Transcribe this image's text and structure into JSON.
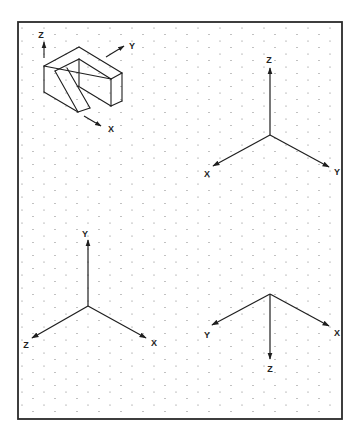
{
  "frame": {
    "x": 18,
    "y": 22,
    "w": 324,
    "h": 397,
    "stroke": "#2a2a2a",
    "stroke_width": 1.8
  },
  "grid": {
    "type": "isometric-dot",
    "dx": 11,
    "dy": 13,
    "dot_color": "#777777",
    "dot_radius": 0.6
  },
  "colors": {
    "line": "#1e1e1e",
    "label": "#222222"
  },
  "object": {
    "name": "isometric-bracket-sketch",
    "edges": [
      [
        44,
        66,
        79,
        47
      ],
      [
        79,
        47,
        122,
        73
      ],
      [
        122,
        73,
        111,
        79
      ],
      [
        111,
        79,
        44,
        66
      ],
      [
        44,
        66,
        44,
        92
      ],
      [
        44,
        92,
        78,
        112
      ],
      [
        111,
        79,
        111,
        106
      ],
      [
        122,
        73,
        122,
        101
      ],
      [
        122,
        101,
        111,
        106
      ],
      [
        79,
        59,
        111,
        79
      ],
      [
        79,
        59,
        79,
        86
      ],
      [
        78,
        86,
        111,
        106
      ],
      [
        55,
        71,
        79,
        59
      ],
      [
        55,
        71,
        78,
        112
      ],
      [
        67,
        68,
        90,
        108
      ],
      [
        78,
        112,
        90,
        108
      ]
    ],
    "axes": [
      {
        "label": "Z",
        "from": [
          44,
          58
        ],
        "to": [
          44,
          42
        ],
        "label_pos": [
          41,
          38
        ]
      },
      {
        "label": "Y",
        "from": [
          106,
          57
        ],
        "to": [
          124,
          46
        ],
        "label_pos": [
          132,
          49
        ]
      },
      {
        "label": "X",
        "from": [
          84,
          116
        ],
        "to": [
          101,
          126
        ],
        "label_pos": [
          111,
          132
        ]
      }
    ]
  },
  "triads": [
    {
      "name": "triad-top-right",
      "origin": [
        270,
        135
      ],
      "axes": [
        {
          "label": "Z",
          "to": [
            270,
            68
          ],
          "label_pos": [
            269,
            63
          ]
        },
        {
          "label": "X",
          "to": [
            213,
            166
          ],
          "label_pos": [
            207,
            177
          ]
        },
        {
          "label": "Y",
          "to": [
            329,
            167
          ],
          "label_pos": [
            337,
            175
          ]
        }
      ]
    },
    {
      "name": "triad-bottom-left",
      "origin": [
        88,
        306
      ],
      "axes": [
        {
          "label": "Y",
          "to": [
            88,
            240
          ],
          "label_pos": [
            85,
            237
          ]
        },
        {
          "label": "Z",
          "to": [
            32,
            338
          ],
          "label_pos": [
            26,
            348
          ]
        },
        {
          "label": "X",
          "to": [
            146,
            338
          ],
          "label_pos": [
            154,
            346
          ]
        }
      ]
    },
    {
      "name": "triad-bottom-right",
      "origin": [
        270,
        294
      ],
      "axes": [
        {
          "label": "Y",
          "to": [
            212,
            325
          ],
          "label_pos": [
            207,
            338
          ]
        },
        {
          "label": "X",
          "to": [
            329,
            326
          ],
          "label_pos": [
            337,
            336
          ]
        },
        {
          "label": "Z",
          "to": [
            270,
            359
          ],
          "label_pos": [
            270,
            372
          ]
        }
      ]
    }
  ]
}
